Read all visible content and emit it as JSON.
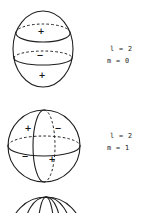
{
  "figure": {
    "background_color": "#ffffff",
    "stroke_color": "#1f1f1f",
    "spheres": [
      {
        "name": "sphere-l2-m0",
        "labels": {
          "l": "l = 2",
          "m": "m = 0"
        },
        "signs": [
          {
            "symbol": "+",
            "region": "upper-cap"
          },
          {
            "symbol": "−",
            "region": "middle-band"
          },
          {
            "symbol": "+",
            "region": "lower-cap"
          }
        ]
      },
      {
        "name": "sphere-l2-m1",
        "labels": {
          "l": "l = 2",
          "m": "m = 1"
        },
        "signs": [
          {
            "symbol": "+",
            "region": "upper-left"
          },
          {
            "symbol": "−",
            "region": "upper-right"
          },
          {
            "symbol": "−",
            "region": "lower-left"
          },
          {
            "symbol": "+",
            "region": "lower-right"
          }
        ]
      },
      {
        "name": "sphere-partial-cutoff",
        "labels": {
          "l": "",
          "m": ""
        },
        "signs": []
      }
    ]
  }
}
